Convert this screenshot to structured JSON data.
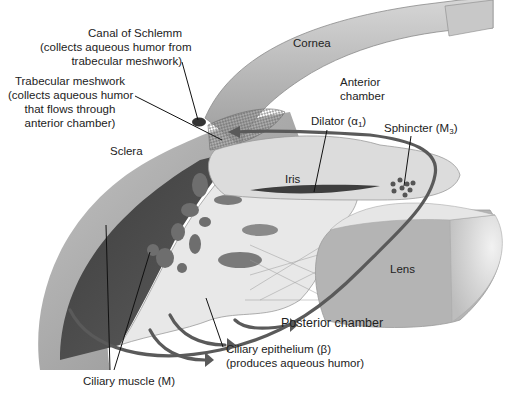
{
  "diagram": {
    "colors": {
      "background": "#ffffff",
      "cornea": "#b9b9b9",
      "sclera": "#9a9a9a",
      "ciliary_muscle": "#4a4a4a",
      "iris": "#d8d8d8",
      "lens": "#b0b0b0",
      "flow_arrow": "#5a5a5a",
      "leader_line": "#111111",
      "text": "#222222"
    },
    "labels": {
      "canal_of_schlemm": {
        "title": "Canal of Schlemm",
        "line2": "(collects aqueous humor from",
        "line3": "trabecular meshwork)"
      },
      "trabecular_meshwork": {
        "title": "Trabecular meshwork",
        "line2": "(collects aqueous humor",
        "line3": "that flows through",
        "line4": "anterior chamber)"
      },
      "cornea": "Cornea",
      "anterior_chamber": {
        "line1": "Anterior",
        "line2": "chamber"
      },
      "sclera": "Sclera",
      "dilator": {
        "text": "Dilator (α",
        "sub": "1",
        "close": ")"
      },
      "sphincter": {
        "text": "Sphincter (M",
        "sub": "3",
        "close": ")"
      },
      "iris": "Iris",
      "lens": "Lens",
      "posterior_chamber": "Posterior chamber",
      "ciliary_epithelium": {
        "title": "Ciliary epithelium (β)",
        "line2": "(produces aqueous humor)"
      },
      "ciliary_muscle": "Ciliary muscle (M)"
    }
  }
}
